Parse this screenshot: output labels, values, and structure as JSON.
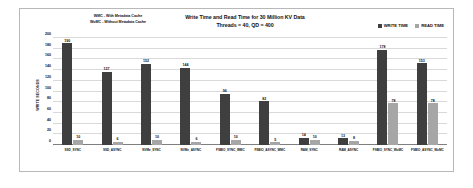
{
  "annotation": {
    "line1": "WMC - With Metadata Cache",
    "line2": "WoMC - Without Metadata Cache"
  },
  "legend": {
    "items": [
      {
        "label": "WRITE TIME",
        "color": "#3f3f3f"
      },
      {
        "label": "READ TIME",
        "color": "#a6a6a6"
      }
    ]
  },
  "colors": {
    "write": "#3f3f3f",
    "read": "#a6a6a6",
    "grid": "#d9d9d9",
    "frame": "#b8b8b8"
  },
  "chart_data": {
    "type": "bar",
    "title": "Write Time and Read Time for 30 Million KV Data",
    "subtitle": "Threads = 40, QD = 400",
    "xlabel": "",
    "ylabel": "WRITE   SECONDS",
    "ylim": [
      0,
      200
    ],
    "yticks": [
      0,
      20,
      40,
      60,
      80,
      100,
      120,
      140,
      160,
      180,
      200
    ],
    "grid": true,
    "legend_position": "top-right",
    "categories": [
      "SSD_SYNC",
      "SSD_ASYNC",
      "NVMe_SYNC",
      "NVMe_ASYNC",
      "FSBIO_SYNC_WMC",
      "FSBIO_ASYNC_WMC",
      "RAM_SYNC",
      "RAM_ASYNC",
      "FSBIO_SYNC_WoMC",
      "FSBIO_ASYNC_WoMC"
    ],
    "series": [
      {
        "name": "WRITE TIME",
        "color": "#3f3f3f",
        "values": [
          190,
          137,
          152,
          144,
          96,
          82,
          14,
          13,
          178,
          153
        ]
      },
      {
        "name": "READ TIME",
        "color": "#a6a6a6",
        "values": [
          10,
          6,
          10,
          6,
          10,
          5,
          10,
          8,
          78,
          78
        ]
      }
    ]
  }
}
